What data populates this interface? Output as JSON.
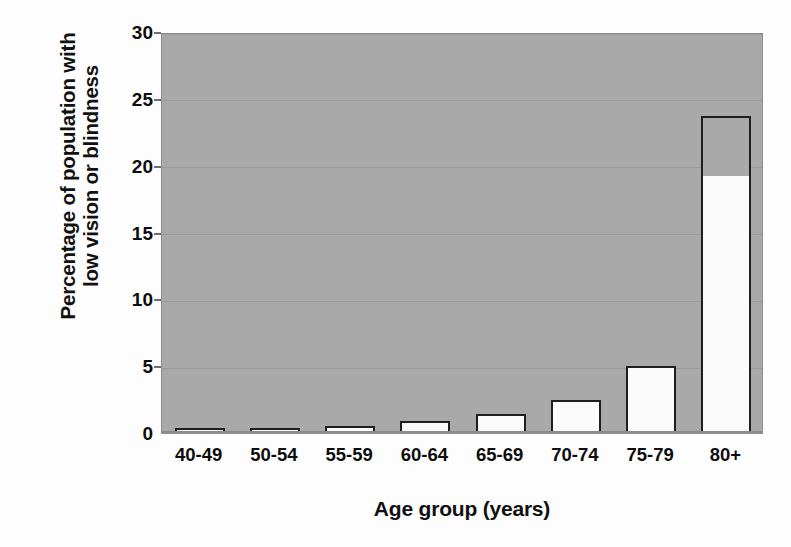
{
  "chart_data": {
    "type": "bar",
    "title": "",
    "subtitle": "",
    "xlabel": "Age group (years)",
    "ylabel_lines": [
      "Percentage of population with",
      "low vision or blindness"
    ],
    "ylabel": "Percentage of population with low vision or blindness",
    "categories": [
      "40-49",
      "50-54",
      "55-59",
      "60-64",
      "65-69",
      "70-74",
      "75-79",
      "80+"
    ],
    "values": [
      0.35,
      0.4,
      0.5,
      0.9,
      1.4,
      2.5,
      5.0,
      23.7
    ],
    "ylim": [
      0,
      30
    ],
    "ytick_labels": [
      "0",
      "5",
      "10",
      "15",
      "20",
      "25",
      "30"
    ],
    "ytick_values": [
      0,
      5,
      10,
      15,
      20,
      25,
      30
    ],
    "grid": true,
    "legend": null,
    "legend_position": "none",
    "colors": {
      "plot_background": "#a9a9a9",
      "figure_background": "#fdfdfd",
      "bar_fill": "#fbfbfb",
      "bar_outline": "#1e1e1e",
      "gridline": "#9a9a9a",
      "text": "#0d0d0d"
    }
  }
}
